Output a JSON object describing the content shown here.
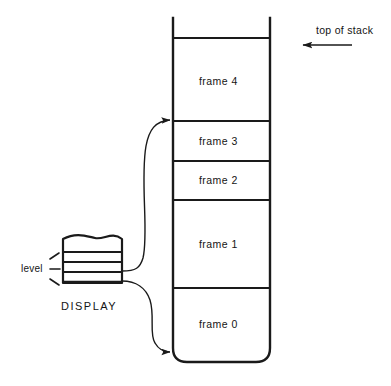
{
  "diagram": {
    "line_color": "#1a1a1a",
    "text_color": "#141414",
    "background": "#ffffff",
    "stack": {
      "name": "stack",
      "top_marker": {
        "label": "top of stack",
        "arrow_direction": "left"
      },
      "frames": [
        {
          "label": "frame 4",
          "index": 4
        },
        {
          "label": "frame 3",
          "index": 3
        },
        {
          "label": "frame 2",
          "index": 2
        },
        {
          "label": "frame 1",
          "index": 1
        },
        {
          "label": "frame 0",
          "index": 0
        }
      ]
    },
    "display": {
      "label": "DISPLAY",
      "level_label": "level",
      "slot_count": 4
    },
    "pointers": [
      {
        "from": "display-upper-slot",
        "to": "frame-4-base",
        "shape": "s-curve-up"
      },
      {
        "from": "display-lower-slot",
        "to": "frame-0-base",
        "shape": "s-curve-down"
      }
    ]
  }
}
